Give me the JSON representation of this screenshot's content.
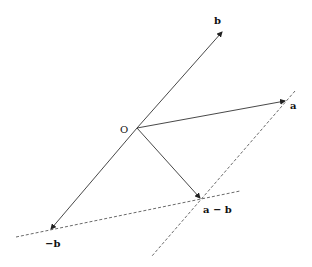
{
  "diagram": {
    "points": {
      "origin": {
        "label": "O",
        "x": 137,
        "y": 128
      },
      "b": {
        "label": "b",
        "x": 222,
        "y": 32
      },
      "a": {
        "label": "a",
        "x": 285,
        "y": 101
      },
      "neg_b": {
        "label": "−b",
        "x": 51,
        "y": 229
      },
      "a_minus_b": {
        "label": "a − b",
        "x": 200,
        "y": 198
      }
    },
    "solid_vectors": [
      {
        "from": "origin",
        "to": "b",
        "arrow": true
      },
      {
        "from": "origin",
        "to": "a",
        "arrow": true
      },
      {
        "from": "origin",
        "to": "neg_b",
        "arrow": true
      },
      {
        "from": "origin",
        "to": "a_minus_b",
        "arrow": true
      }
    ],
    "dashed_lines": [
      {
        "name": "parallel-through-a",
        "x1": 295,
        "y1": 91,
        "x2": 152,
        "y2": 256
      },
      {
        "name": "line-through-neg-b",
        "x1": 16,
        "y1": 237,
        "x2": 240,
        "y2": 191
      }
    ],
    "colors": {
      "line": "#333333",
      "text": "#111111",
      "background": "#ffffff"
    }
  }
}
